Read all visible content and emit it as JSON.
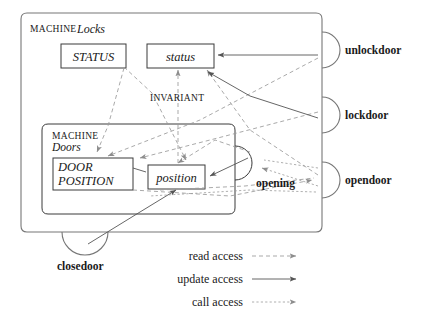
{
  "diagram": {
    "title_outer_keyword": "MACHINE",
    "title_outer_name": "Locks",
    "title_inner_keyword": "MACHINE",
    "title_inner_name": "Doors",
    "invariant_label": "INVARIANT",
    "sets": [
      {
        "id": "status-set",
        "label": "STATUS"
      },
      {
        "id": "door-position-set",
        "label": "DOOR\nPOSITION",
        "line1": "DOOR",
        "line2": "POSITION"
      }
    ],
    "variables": [
      {
        "id": "status-var",
        "label": "status"
      },
      {
        "id": "position-var",
        "label": "position"
      }
    ],
    "operations": [
      {
        "id": "unlockdoor",
        "label": "unlockdoor",
        "owner": "Locks",
        "edge": "right"
      },
      {
        "id": "lockdoor",
        "label": "lockdoor",
        "owner": "Locks",
        "edge": "right"
      },
      {
        "id": "opendoor",
        "label": "opendoor",
        "owner": "Locks",
        "edge": "right"
      },
      {
        "id": "closedoor",
        "label": "closedoor",
        "owner": "Locks",
        "edge": "bottom"
      },
      {
        "id": "opening",
        "label": "opening",
        "owner": "Doors",
        "edge": "right"
      }
    ],
    "legend": {
      "items": [
        {
          "id": "read-access",
          "label": "read access",
          "style": "dashed"
        },
        {
          "id": "update-access",
          "label": "update access",
          "style": "solid"
        },
        {
          "id": "call-access",
          "label": "call access",
          "style": "dotted"
        }
      ]
    },
    "colors": {
      "outer_box_stroke": "#777777",
      "inner_box_stroke": "#3a3a3a",
      "var_box_stroke": "#3a3a3a",
      "read_arrow": "#9a9a9a",
      "update_arrow": "#555555",
      "call_arrow": "#9a9a9a",
      "text": "#1a1a1a",
      "background": "#ffffff"
    }
  }
}
